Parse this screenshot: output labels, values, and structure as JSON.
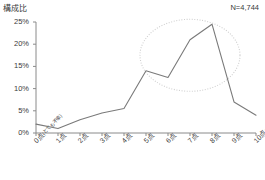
{
  "chart_data": {
    "type": "line",
    "title": "",
    "ylabel": "構成比",
    "xlabel": "",
    "annotation_n": "N=4,744",
    "categories": [
      "0点",
      "1点",
      "2点",
      "3点",
      "4点",
      "5点",
      "6点",
      "7点",
      "8点",
      "9点",
      "10点"
    ],
    "category_subs": [
      "(とても不幸)",
      "",
      "",
      "",
      "",
      "",
      "",
      "",
      "",
      "",
      "(とても幸せ)"
    ],
    "values": [
      2.0,
      1.0,
      3.0,
      4.5,
      5.5,
      14.0,
      12.5,
      21.0,
      24.5,
      7.0,
      4.0
    ],
    "ytick_labels": [
      "0%",
      "5%",
      "10%",
      "15%",
      "20%",
      "25%"
    ],
    "ytick_values": [
      0,
      5,
      10,
      15,
      20,
      25
    ],
    "ylim": [
      0,
      25
    ],
    "grid": false,
    "legend": "none",
    "series_color": "#7a7a7a",
    "axis_color": "#8a8a8a",
    "annotation_ellipse_color": "#cfcfcf",
    "annotation_ellipse": {
      "center_category": "7点",
      "covers": [
        "5点",
        "6点",
        "7点",
        "8点",
        "9点"
      ]
    }
  }
}
